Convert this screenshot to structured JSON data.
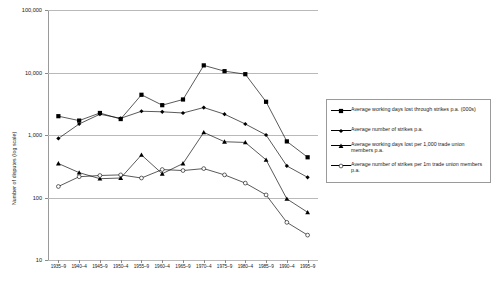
{
  "chart_data": {
    "type": "line",
    "title": "",
    "xlabel": "",
    "ylabel": "Number of disputes (log scale)",
    "scale": "log",
    "ylim": [
      10,
      100000
    ],
    "yticks": [
      "10",
      "100",
      "1,000",
      "10,000",
      "100,000"
    ],
    "ytick_values": [
      10,
      100,
      1000,
      10000,
      100000
    ],
    "grid": true,
    "legend_position": "right",
    "categories": [
      "1935–9",
      "1940–4",
      "1945–9",
      "1950–4",
      "1955–9",
      "1960–4",
      "1965–9",
      "1970–4",
      "1975–9",
      "1980–4",
      "1985–9",
      "1990–4",
      "1995–9"
    ],
    "series": [
      {
        "name": "Average working days lost through strikes p.a. (000s)",
        "marker": "filled-square",
        "values": [
          2000,
          1700,
          2250,
          1800,
          4400,
          3000,
          3700,
          13000,
          10500,
          9400,
          3400,
          790,
          440
        ]
      },
      {
        "name": "Average number of strikes p.a.",
        "marker": "filled-diamond",
        "values": [
          880,
          1500,
          2150,
          1850,
          2400,
          2350,
          2250,
          2750,
          2150,
          1500,
          1000,
          320,
          210
        ]
      },
      {
        "name": "Average working days lost per 1,000 trade union members p.a.",
        "marker": "filled-triangle",
        "values": [
          350,
          250,
          200,
          205,
          480,
          240,
          350,
          1100,
          780,
          760,
          400,
          95,
          58
        ]
      },
      {
        "name": "Average number of strikes per 1m trade union members p.a.",
        "marker": "open-circle",
        "values": [
          150,
          215,
          225,
          230,
          205,
          280,
          270,
          290,
          230,
          170,
          110,
          40,
          25
        ]
      }
    ]
  },
  "legend": {
    "items": [
      {
        "label": "Average working days lost through strikes p.a. (000s)",
        "marker": "filled-square"
      },
      {
        "label": "Average number of strikes p.a.",
        "marker": "filled-diamond"
      },
      {
        "label": "Average working days lost per 1,000 trade union members p.a.",
        "marker": "filled-triangle"
      },
      {
        "label": "Average number of strikes per 1m trade union members p.a.",
        "marker": "open-circle"
      }
    ]
  }
}
